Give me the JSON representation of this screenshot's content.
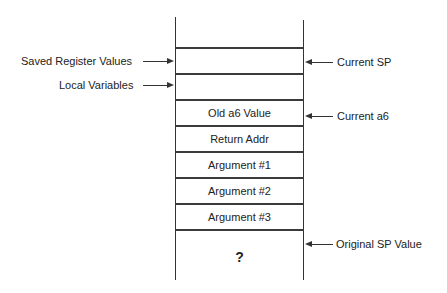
{
  "diagram": {
    "stack_cells": [
      {
        "label": ""
      },
      {
        "label": ""
      },
      {
        "label": "Old a6 Value"
      },
      {
        "label": "Return Addr"
      },
      {
        "label": "Argument #1"
      },
      {
        "label": "Argument #2"
      },
      {
        "label": "Argument #3"
      },
      {
        "label": "?"
      }
    ],
    "left_labels": [
      {
        "label": "Saved Register Values",
        "points_to_cell": 0
      },
      {
        "label": "Local Variables",
        "points_to_cell": 1
      }
    ],
    "right_labels": [
      {
        "label": "Current SP",
        "points_to_boundary": "top of Saved Register Values"
      },
      {
        "label": "Current a6",
        "points_to_cell": 2
      },
      {
        "label": "Original SP Value",
        "points_to_boundary": "top of ?"
      }
    ]
  }
}
